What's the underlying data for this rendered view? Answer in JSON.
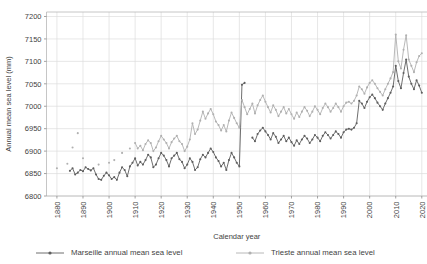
{
  "title_fragment": "",
  "chart_data": {
    "type": "line",
    "title": "",
    "xlabel": "Calendar year",
    "ylabel": "Annual mean sea level (mm)",
    "xlim": [
      1876,
      2022
    ],
    "ylim": [
      6800,
      7210
    ],
    "xticks": [
      1880,
      1890,
      1900,
      1910,
      1920,
      1930,
      1940,
      1950,
      1960,
      1970,
      1980,
      1990,
      2000,
      2010,
      2020
    ],
    "yticks": [
      6800,
      6850,
      6900,
      6950,
      7000,
      7050,
      7100,
      7150,
      7200
    ],
    "grid": true,
    "legend_position": "bottom",
    "series": [
      {
        "name": "Marseille annual mean sea level",
        "color": "#5e5e5e",
        "marker": "circle",
        "points": [
          [
            1885,
            6856
          ],
          [
            1886,
            6862
          ],
          [
            1887,
            6848
          ],
          [
            1888,
            6852
          ],
          [
            1889,
            6858
          ],
          [
            1890,
            6855
          ],
          [
            1891,
            6864
          ],
          [
            1892,
            6860
          ],
          [
            1893,
            6857
          ],
          [
            1894,
            6862
          ],
          [
            1895,
            6848
          ],
          [
            1896,
            6838
          ],
          [
            1897,
            6836
          ],
          [
            1898,
            6845
          ],
          [
            1899,
            6852
          ],
          [
            1900,
            6846
          ],
          [
            1901,
            6838
          ],
          [
            1902,
            6842
          ],
          [
            1903,
            6836
          ],
          [
            1904,
            6852
          ],
          [
            1905,
            6864
          ],
          [
            1906,
            6858
          ],
          [
            1907,
            6844
          ],
          [
            1908,
            6866
          ],
          [
            1909,
            6874
          ],
          [
            1910,
            6884
          ],
          [
            1911,
            6868
          ],
          [
            1912,
            6876
          ],
          [
            1913,
            6870
          ],
          [
            1914,
            6880
          ],
          [
            1915,
            6892
          ],
          [
            1916,
            6886
          ],
          [
            1917,
            6864
          ],
          [
            1918,
            6870
          ],
          [
            1919,
            6884
          ],
          [
            1920,
            6896
          ],
          [
            1921,
            6890
          ],
          [
            1922,
            6880
          ],
          [
            1923,
            6866
          ],
          [
            1924,
            6884
          ],
          [
            1925,
            6890
          ],
          [
            1926,
            6896
          ],
          [
            1927,
            6882
          ],
          [
            1928,
            6876
          ],
          [
            1929,
            6862
          ],
          [
            1930,
            6870
          ],
          [
            1931,
            6884
          ],
          [
            1932,
            6876
          ],
          [
            1933,
            6858
          ],
          [
            1934,
            6864
          ],
          [
            1935,
            6882
          ],
          [
            1936,
            6892
          ],
          [
            1937,
            6886
          ],
          [
            1938,
            6896
          ],
          [
            1939,
            6906
          ],
          [
            1940,
            6898
          ],
          [
            1941,
            6886
          ],
          [
            1942,
            6878
          ],
          [
            1943,
            6866
          ],
          [
            1944,
            6874
          ],
          [
            1945,
            6858
          ],
          [
            1946,
            6880
          ],
          [
            1947,
            6896
          ],
          [
            1948,
            6886
          ],
          [
            1949,
            6874
          ],
          [
            1950,
            6866
          ],
          [
            1951,
            7048
          ],
          [
            1952,
            7052
          ],
          [
            1955,
            6930
          ],
          [
            1956,
            6922
          ],
          [
            1957,
            6938
          ],
          [
            1958,
            6946
          ],
          [
            1959,
            6952
          ],
          [
            1960,
            6944
          ],
          [
            1961,
            6936
          ],
          [
            1962,
            6926
          ],
          [
            1963,
            6940
          ],
          [
            1964,
            6932
          ],
          [
            1965,
            6918
          ],
          [
            1966,
            6926
          ],
          [
            1967,
            6934
          ],
          [
            1968,
            6922
          ],
          [
            1969,
            6930
          ],
          [
            1970,
            6920
          ],
          [
            1971,
            6912
          ],
          [
            1972,
            6924
          ],
          [
            1973,
            6916
          ],
          [
            1974,
            6926
          ],
          [
            1975,
            6934
          ],
          [
            1976,
            6928
          ],
          [
            1977,
            6918
          ],
          [
            1978,
            6926
          ],
          [
            1979,
            6936
          ],
          [
            1980,
            6930
          ],
          [
            1981,
            6922
          ],
          [
            1982,
            6934
          ],
          [
            1983,
            6942
          ],
          [
            1984,
            6936
          ],
          [
            1985,
            6928
          ],
          [
            1986,
            6936
          ],
          [
            1987,
            6944
          ],
          [
            1988,
            6938
          ],
          [
            1989,
            6930
          ],
          [
            1990,
            6942
          ],
          [
            1991,
            6948
          ],
          [
            1992,
            6950
          ],
          [
            1993,
            6948
          ],
          [
            1994,
            6952
          ],
          [
            1995,
            6962
          ],
          [
            1996,
            7012
          ],
          [
            1997,
            7006
          ],
          [
            1998,
            6996
          ],
          [
            1999,
            7010
          ],
          [
            2000,
            7020
          ],
          [
            2001,
            7026
          ],
          [
            2002,
            7018
          ],
          [
            2003,
            7008
          ],
          [
            2004,
            7000
          ],
          [
            2005,
            6992
          ],
          [
            2006,
            7006
          ],
          [
            2007,
            7018
          ],
          [
            2008,
            7030
          ],
          [
            2009,
            7044
          ],
          [
            2010,
            7090
          ],
          [
            2011,
            7056
          ],
          [
            2012,
            7040
          ],
          [
            2013,
            7074
          ],
          [
            2014,
            7104
          ],
          [
            2015,
            7066
          ],
          [
            2016,
            7050
          ],
          [
            2017,
            7038
          ],
          [
            2018,
            7058
          ],
          [
            2019,
            7046
          ],
          [
            2020,
            7030
          ]
        ]
      },
      {
        "name": "Trieste annual mean sea level",
        "color": "#b0b0b0",
        "marker": "circle",
        "points": [
          [
            1880,
            6862
          ],
          [
            1884,
            6872
          ],
          [
            1886,
            6908
          ],
          [
            1888,
            6940
          ],
          [
            1890,
            6884
          ],
          [
            1896,
            6870
          ],
          [
            1900,
            6874
          ],
          [
            1902,
            6880
          ],
          [
            1905,
            6896
          ],
          [
            1908,
            6906
          ],
          [
            1910,
            6918
          ],
          [
            1911,
            6906
          ],
          [
            1912,
            6912
          ],
          [
            1913,
            6902
          ],
          [
            1914,
            6916
          ],
          [
            1915,
            6924
          ],
          [
            1916,
            6918
          ],
          [
            1917,
            6900
          ],
          [
            1918,
            6908
          ],
          [
            1919,
            6922
          ],
          [
            1920,
            6934
          ],
          [
            1921,
            6926
          ],
          [
            1922,
            6918
          ],
          [
            1923,
            6906
          ],
          [
            1924,
            6920
          ],
          [
            1925,
            6928
          ],
          [
            1926,
            6934
          ],
          [
            1927,
            6922
          ],
          [
            1928,
            6916
          ],
          [
            1929,
            6900
          ],
          [
            1930,
            6910
          ],
          [
            1931,
            6926
          ],
          [
            1932,
            6962
          ],
          [
            1933,
            6938
          ],
          [
            1934,
            6948
          ],
          [
            1935,
            6968
          ],
          [
            1936,
            6988
          ],
          [
            1937,
            6972
          ],
          [
            1938,
            6984
          ],
          [
            1939,
            6994
          ],
          [
            1940,
            6982
          ],
          [
            1941,
            6966
          ],
          [
            1942,
            6958
          ],
          [
            1943,
            6946
          ],
          [
            1944,
            6958
          ],
          [
            1945,
            6944
          ],
          [
            1946,
            6968
          ],
          [
            1947,
            6986
          ],
          [
            1948,
            6974
          ],
          [
            1949,
            6962
          ],
          [
            1950,
            6952
          ],
          [
            1951,
            7014
          ],
          [
            1952,
            6998
          ],
          [
            1953,
            6982
          ],
          [
            1954,
            6994
          ],
          [
            1955,
            7006
          ],
          [
            1956,
            6984
          ],
          [
            1957,
            7002
          ],
          [
            1958,
            7014
          ],
          [
            1959,
            7024
          ],
          [
            1960,
            7010
          ],
          [
            1961,
            6998
          ],
          [
            1962,
            6986
          ],
          [
            1963,
            7002
          ],
          [
            1964,
            6992
          ],
          [
            1965,
            6978
          ],
          [
            1966,
            6988
          ],
          [
            1967,
            6998
          ],
          [
            1968,
            6984
          ],
          [
            1969,
            6994
          ],
          [
            1970,
            6982
          ],
          [
            1971,
            6972
          ],
          [
            1972,
            6986
          ],
          [
            1973,
            6976
          ],
          [
            1974,
            6988
          ],
          [
            1975,
            6998
          ],
          [
            1976,
            6990
          ],
          [
            1977,
            6978
          ],
          [
            1978,
            6988
          ],
          [
            1979,
            7000
          ],
          [
            1980,
            6992
          ],
          [
            1981,
            6982
          ],
          [
            1982,
            6996
          ],
          [
            1983,
            7006
          ],
          [
            1984,
            6998
          ],
          [
            1985,
            6988
          ],
          [
            1986,
            6996
          ],
          [
            1987,
            7006
          ],
          [
            1988,
            6998
          ],
          [
            1989,
            6988
          ],
          [
            1990,
            7000
          ],
          [
            1991,
            7008
          ],
          [
            1992,
            7010
          ],
          [
            1993,
            7006
          ],
          [
            1994,
            7012
          ],
          [
            1995,
            7024
          ],
          [
            1996,
            7044
          ],
          [
            1997,
            7038
          ],
          [
            1998,
            7028
          ],
          [
            1999,
            7042
          ],
          [
            2000,
            7052
          ],
          [
            2001,
            7058
          ],
          [
            2002,
            7050
          ],
          [
            2003,
            7040
          ],
          [
            2004,
            7032
          ],
          [
            2005,
            7024
          ],
          [
            2006,
            7038
          ],
          [
            2007,
            7050
          ],
          [
            2008,
            7062
          ],
          [
            2009,
            7076
          ],
          [
            2010,
            7160
          ],
          [
            2011,
            7100
          ],
          [
            2012,
            7084
          ],
          [
            2013,
            7126
          ],
          [
            2014,
            7158
          ],
          [
            2015,
            7104
          ],
          [
            2016,
            7090
          ],
          [
            2017,
            7076
          ],
          [
            2018,
            7098
          ],
          [
            2019,
            7112
          ],
          [
            2020,
            7118
          ]
        ]
      }
    ]
  },
  "legend": {
    "items": [
      {
        "label": "Marseille annual mean sea level",
        "color": "#5e5e5e"
      },
      {
        "label": "Trieste annual mean sea level",
        "color": "#b0b0b0"
      }
    ]
  }
}
